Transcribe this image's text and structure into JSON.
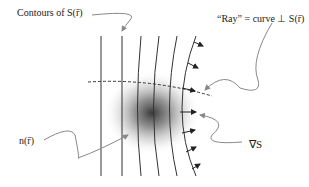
{
  "labels": {
    "contours": "Contours of S(r̄)",
    "ray": "“Ray” = curve ⊥ S(r̄)",
    "index": "n(r̄)",
    "gradient": "∇S"
  },
  "colors": {
    "line": "#333333",
    "pointer": "#888888",
    "blob_center": "#333333"
  }
}
